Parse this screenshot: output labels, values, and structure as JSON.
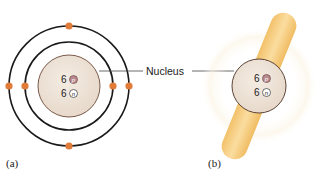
{
  "figure": {
    "panel_a": {
      "label": "(a)",
      "description": "Bohr model of carbon atom",
      "protons": {
        "count": "6",
        "symbol": "p"
      },
      "neutrons": {
        "count": "6",
        "symbol": "n"
      },
      "orbits": [
        {
          "name": "inner-shell",
          "electrons": 2
        },
        {
          "name": "outer-shell",
          "electrons": 4
        }
      ]
    },
    "panel_b": {
      "label": "(b)",
      "description": "Electron cloud model of carbon atom",
      "protons": {
        "count": "6",
        "symbol": "p"
      },
      "neutrons": {
        "count": "6",
        "symbol": "n"
      }
    },
    "callout": {
      "text": "Nucleus"
    }
  },
  "colors": {
    "electron": "#E07B3A",
    "nucleus_fill": "#EDE2D6",
    "nucleus_stroke": "#7A5A4A",
    "proton_fill": "#B98A8E",
    "neutron_fill": "#FFFFFF",
    "orbit": "#1a1a1a",
    "cloud": "#F6CC7E"
  }
}
